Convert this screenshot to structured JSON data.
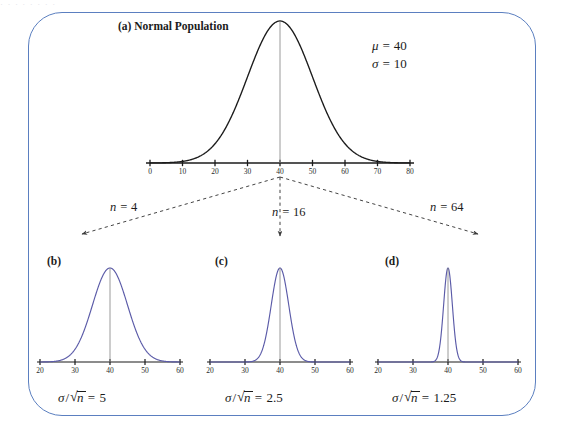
{
  "figure": {
    "border_color": "#5b7fc0",
    "background": "#ffffff",
    "top_bleed_text": "· · · · · · · ·"
  },
  "population": {
    "tag": "(a)",
    "title": "(a) Normal Population",
    "mu_label": "μ =",
    "mu_value": "40",
    "sigma_label": "σ =",
    "sigma_value": "10",
    "curve_color": "#1b1b1b",
    "center_line_color": "#8a8a8a"
  },
  "branches": [
    {
      "name": "n-4",
      "label_sym": "n =",
      "label_value": "4"
    },
    {
      "name": "n-16",
      "label_sym": "n =",
      "label_value": "16"
    },
    {
      "name": "n-64",
      "label_sym": "n =",
      "label_value": "64"
    }
  ],
  "sampling_panels": [
    {
      "tag": "(b)",
      "n": 4,
      "caption_sym": "σ",
      "caption_var": "n",
      "caption_value": "5",
      "curve_color": "#5b5ba8"
    },
    {
      "tag": "(c)",
      "n": 16,
      "caption_sym": "σ",
      "caption_var": "n",
      "caption_value": "2.5",
      "curve_color": "#5b5ba8"
    },
    {
      "tag": "(d)",
      "n": 64,
      "caption_sym": "σ",
      "caption_var": "n",
      "caption_value": "1.25",
      "curve_color": "#5b5ba8"
    }
  ],
  "chart_data": {
    "type": "line",
    "title": "(a) Normal Population",
    "charts": [
      {
        "panel": "(a)",
        "name": "normal-population",
        "distribution": "normal",
        "mean": 40,
        "sd": 10,
        "xlim": [
          0,
          80
        ],
        "xticks": [
          0,
          10,
          20,
          30,
          40,
          50,
          60,
          70,
          80
        ],
        "xtick_labels": [
          "0",
          "10",
          "20",
          "30",
          "40",
          "50",
          "60",
          "70",
          "80"
        ],
        "grid": false,
        "center_line_at": 40,
        "curve_color": "#1b1b1b",
        "annotations": [
          "μ = 40",
          "σ = 10"
        ]
      },
      {
        "panel": "(b)",
        "name": "sampling-distribution-n4",
        "distribution": "normal",
        "mean": 40,
        "sd": 5,
        "n": 4,
        "xlim": [
          20,
          60
        ],
        "xticks": [
          20,
          30,
          40,
          50,
          60
        ],
        "xtick_labels": [
          "20",
          "30",
          "40",
          "50",
          "60"
        ],
        "grid": false,
        "center_line_at": 40,
        "curve_color": "#5b5ba8",
        "annotations": [
          "σ/√n = 5"
        ]
      },
      {
        "panel": "(c)",
        "name": "sampling-distribution-n16",
        "distribution": "normal",
        "mean": 40,
        "sd": 2.5,
        "n": 16,
        "xlim": [
          20,
          60
        ],
        "xticks": [
          20,
          30,
          40,
          50,
          60
        ],
        "xtick_labels": [
          "20",
          "30",
          "40",
          "50",
          "60"
        ],
        "grid": false,
        "center_line_at": 40,
        "curve_color": "#5b5ba8",
        "annotations": [
          "σ/√n = 2.5"
        ]
      },
      {
        "panel": "(d)",
        "name": "sampling-distribution-n64",
        "distribution": "normal",
        "mean": 40,
        "sd": 1.25,
        "n": 64,
        "xlim": [
          20,
          60
        ],
        "xticks": [
          20,
          30,
          40,
          50,
          60
        ],
        "xtick_labels": [
          "20",
          "30",
          "40",
          "50",
          "60"
        ],
        "grid": false,
        "center_line_at": 40,
        "curve_color": "#5b5ba8",
        "annotations": [
          "σ/√n = 1.25"
        ]
      }
    ]
  }
}
